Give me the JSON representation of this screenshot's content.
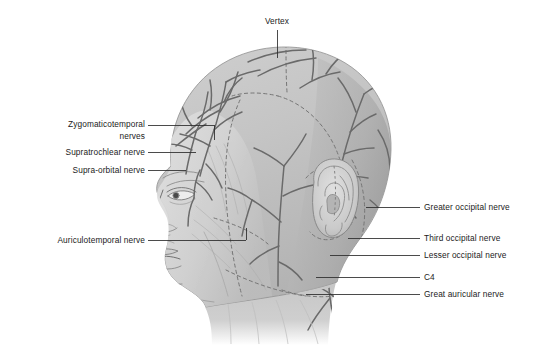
{
  "figure": {
    "background_color": "#ffffff",
    "ink_color": "#1b1b1b",
    "skin_light": "#d7d7d7",
    "skin_mid": "#c0c0c0",
    "skin_dark": "#a6a6a6",
    "nerve_color": "#6e6e6e",
    "dermatome_dash_color": "#7d7d7d",
    "leader_color": "#2b2b2b"
  },
  "labels": {
    "top": [
      {
        "id": "vertex",
        "text": "Vertex",
        "x": 277,
        "y": 22,
        "align": "center"
      }
    ],
    "left": [
      {
        "id": "zygomaticotemporal",
        "line1": "Zygomaticotemporal",
        "line2": "nerves",
        "x": 24,
        "y": 119
      },
      {
        "id": "supratrochlear",
        "text": "Supratrochlear nerve",
        "x": 24,
        "y": 147
      },
      {
        "id": "supraorbital",
        "text": "Supra-orbital nerve",
        "x": 24,
        "y": 165
      },
      {
        "id": "auriculotemporal",
        "text": "Auriculotemporal nerve",
        "x": 24,
        "y": 236
      }
    ],
    "right": [
      {
        "id": "greater-occipital",
        "text": "Greater occipital nerve",
        "x": 424,
        "y": 202
      },
      {
        "id": "third-occipital",
        "text": "Third occipital nerve",
        "x": 424,
        "y": 233
      },
      {
        "id": "lesser-occipital",
        "text": "Lesser occipital nerve",
        "x": 424,
        "y": 250
      },
      {
        "id": "c4",
        "text": "C4",
        "x": 424,
        "y": 272
      },
      {
        "id": "great-auricular",
        "text": "Great auricular nerve",
        "x": 424,
        "y": 289
      }
    ]
  },
  "anatomy": {
    "regions": [
      "scalp",
      "forehead",
      "temple",
      "face-profile",
      "ear",
      "occiput",
      "neck"
    ],
    "features": [
      "eye",
      "nose",
      "lips",
      "chin",
      "jawline",
      "ear-helix",
      "ear-lobule"
    ]
  }
}
